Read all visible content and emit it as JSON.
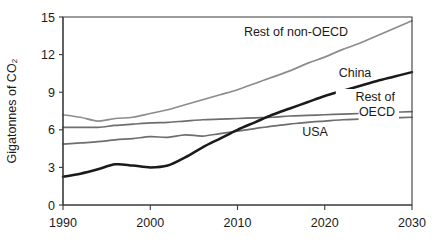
{
  "chart_data": {
    "type": "line",
    "title": "",
    "xlabel": "",
    "ylabel": "Gigatonnes of CO₂",
    "xlim": [
      1990,
      2030
    ],
    "ylim": [
      0,
      15
    ],
    "xticks": [
      1990,
      2000,
      2010,
      2020,
      2030
    ],
    "xtick_labels": [
      "1990",
      "2000",
      "2010",
      "2020",
      "2030"
    ],
    "yticks": [
      0,
      3,
      6,
      9,
      12,
      15
    ],
    "ytick_labels": [
      "0",
      "3",
      "6",
      "9",
      "12",
      "15"
    ],
    "grid": false,
    "legend_position": "inline-annotations",
    "series": [
      {
        "name": "Rest of non-OECD",
        "label": "Rest of non-OECD",
        "color": "#8c8c8c",
        "width": 1.7,
        "x": [
          1990,
          1992,
          1994,
          1996,
          1998,
          2000,
          2002,
          2004,
          2006,
          2008,
          2010,
          2012,
          2014,
          2016,
          2018,
          2020,
          2022,
          2024,
          2026,
          2028,
          2030
        ],
        "values": [
          7.2,
          7.0,
          6.7,
          6.9,
          7.0,
          7.3,
          7.6,
          8.0,
          8.4,
          8.8,
          9.2,
          9.7,
          10.2,
          10.7,
          11.3,
          11.8,
          12.4,
          12.9,
          13.5,
          14.1,
          14.7
        ]
      },
      {
        "name": "Rest of OECD",
        "label": "Rest of\nOECD",
        "color": "#6e6e6e",
        "width": 1.7,
        "x": [
          1990,
          1992,
          1994,
          1996,
          1998,
          2000,
          2002,
          2004,
          2006,
          2008,
          2010,
          2012,
          2014,
          2016,
          2018,
          2020,
          2022,
          2024,
          2026,
          2028,
          2030
        ],
        "values": [
          6.2,
          6.2,
          6.2,
          6.35,
          6.45,
          6.55,
          6.6,
          6.7,
          6.8,
          6.85,
          6.9,
          6.95,
          7.0,
          7.1,
          7.15,
          7.2,
          7.25,
          7.3,
          7.35,
          7.4,
          7.45
        ]
      },
      {
        "name": "USA",
        "label": "USA",
        "color": "#6e6e6e",
        "width": 1.7,
        "x": [
          1990,
          1992,
          1994,
          1996,
          1998,
          2000,
          2002,
          2004,
          2006,
          2008,
          2010,
          2012,
          2014,
          2016,
          2018,
          2020,
          2022,
          2024,
          2026,
          2028,
          2030
        ],
        "values": [
          4.85,
          4.95,
          5.05,
          5.2,
          5.3,
          5.45,
          5.4,
          5.6,
          5.5,
          5.7,
          5.9,
          6.1,
          6.3,
          6.45,
          6.6,
          6.7,
          6.8,
          6.85,
          6.9,
          6.95,
          7.0
        ]
      },
      {
        "name": "China",
        "label": "China",
        "color": "#1a1a1a",
        "width": 2.5,
        "x": [
          1990,
          1992,
          1994,
          1996,
          1998,
          2000,
          2002,
          2004,
          2006,
          2008,
          2010,
          2012,
          2014,
          2016,
          2018,
          2020,
          2022,
          2024,
          2026,
          2028,
          2030
        ],
        "values": [
          2.25,
          2.5,
          2.85,
          3.25,
          3.15,
          3.0,
          3.15,
          3.8,
          4.6,
          5.3,
          6.0,
          6.6,
          7.2,
          7.7,
          8.2,
          8.7,
          9.1,
          9.5,
          9.9,
          10.25,
          10.6
        ]
      }
    ],
    "annotations": [
      {
        "name": "rest-of-non-oecd",
        "text": "Rest of non-OECD",
        "x": 296,
        "y": 36,
        "anchor": "middle",
        "boxed": false
      },
      {
        "name": "china",
        "text": "China",
        "x": 355,
        "y": 77,
        "anchor": "middle",
        "boxed": false
      },
      {
        "name": "rest-of-oecd-line1",
        "text": "Rest of",
        "x": 395,
        "y": 101,
        "anchor": "end",
        "boxed": true
      },
      {
        "name": "rest-of-oecd-line2",
        "text": "OECD",
        "x": 395,
        "y": 116,
        "anchor": "end",
        "boxed": true
      },
      {
        "name": "usa",
        "text": "USA",
        "x": 315,
        "y": 136,
        "anchor": "middle",
        "boxed": false
      }
    ]
  },
  "figure": {
    "plot_left": 63,
    "plot_right": 412,
    "plot_top": 17,
    "plot_bottom": 205
  }
}
